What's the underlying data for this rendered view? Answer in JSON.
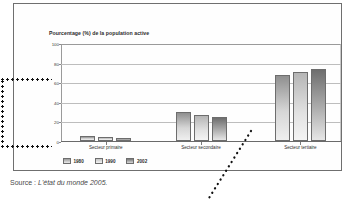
{
  "figure": {
    "title": "Pourcentage (%) de la population active",
    "source_prefix": "Source :",
    "source_work": "L'état du monde 2005.",
    "source_full": "Source : L'état du monde 2005."
  },
  "annotations": {
    "bracket_value_label": "50",
    "pointer_icon": "dotted-leader-line",
    "bracket_icon": "dotted-bracket"
  },
  "chart_data": {
    "type": "bar",
    "title": "Pourcentage (%) de la population active",
    "xlabel": "",
    "ylabel": "Pourcentage (%) de la population active",
    "ylim": [
      0,
      100
    ],
    "yticks": [
      0,
      20,
      40,
      60,
      80,
      100
    ],
    "ytick_labels": [
      "0",
      "20",
      "40",
      "60",
      "80",
      "100"
    ],
    "grid": true,
    "legend_position": "bottom-left",
    "categories": [
      "Secteur primaire",
      "Secteur secondaire",
      "Secteur tertiaire"
    ],
    "series": [
      {
        "name": "1980",
        "values": [
          5,
          30,
          67
        ]
      },
      {
        "name": "1990",
        "values": [
          4,
          27,
          70
        ]
      },
      {
        "name": "2002",
        "values": [
          3,
          25,
          73
        ]
      }
    ]
  }
}
